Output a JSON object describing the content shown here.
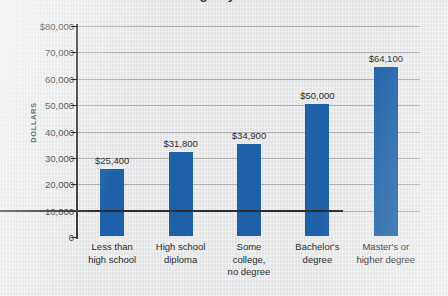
{
  "chart_data": {
    "type": "bar",
    "title": "Median annual earnings by educational attainment",
    "title_cropped": true,
    "xlabel": "",
    "ylabel": "DOLLARS",
    "ylim": [
      0,
      80000
    ],
    "ytick_step": 10000,
    "grid": true,
    "legend": false,
    "bar_color": "#1f61a8",
    "categories": [
      "Less than high school",
      "High school diploma",
      "Some college, no degree",
      "Bachelor's degree",
      "Master's or higher degree"
    ],
    "category_lines": [
      [
        "Less than",
        "high school"
      ],
      [
        "High school",
        "diploma"
      ],
      [
        "Some",
        "college,",
        "no degree"
      ],
      [
        "Bachelor's",
        "degree"
      ],
      [
        "Master's or",
        "higher degree"
      ]
    ],
    "values": [
      25400,
      31800,
      34900,
      50000,
      64100
    ],
    "value_labels": [
      "$25,400",
      "$31,800",
      "$34,900",
      "$50,000",
      "$64,100"
    ],
    "ytick_labels": [
      "$80,000",
      "70,000",
      "60,000",
      "50,000",
      "40,000",
      "30,000",
      "20,000",
      "10,000",
      "0"
    ],
    "ytick_values": [
      80000,
      70000,
      60000,
      50000,
      40000,
      30000,
      20000,
      10000,
      0
    ]
  }
}
